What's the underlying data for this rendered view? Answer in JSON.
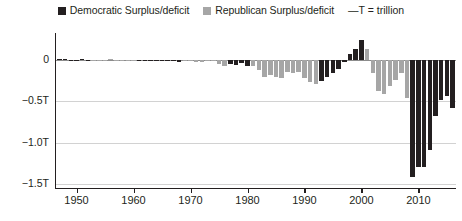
{
  "legend": {
    "democratic": {
      "label": "Democratic Surplus/deficit",
      "color": "#231f20",
      "icon": "square-swatch-icon"
    },
    "republican": {
      "label": "Republican Surplus/deficit",
      "color": "#a6a6a6",
      "icon": "square-swatch-icon"
    },
    "note": "—T = trillion"
  },
  "axes": {
    "y_ticks": [
      "0",
      "−0.5T",
      "−1.0T",
      "−1.5T"
    ],
    "y_tick_values": [
      0,
      -0.5,
      -1.0,
      -1.5
    ],
    "x_ticks": [
      "1950",
      "1960",
      "1970",
      "1980",
      "1990",
      "2000",
      "2010"
    ],
    "x_tick_values": [
      1950,
      1960,
      1970,
      1980,
      1990,
      2000,
      2010
    ]
  },
  "chart_data": {
    "type": "bar",
    "title": "",
    "subtitle": "",
    "xlabel": "",
    "ylabel": "",
    "unit": "trillions of dollars",
    "ylim": [
      -1.55,
      0.3
    ],
    "xlim": [
      1946.4,
      2016.6
    ],
    "grid": true,
    "legend_position": "top-center",
    "series_colors": {
      "Democratic": "#231f20",
      "Republican": "#a6a6a6"
    },
    "categories": [
      1947,
      1948,
      1949,
      1950,
      1951,
      1952,
      1953,
      1954,
      1955,
      1956,
      1957,
      1958,
      1959,
      1960,
      1961,
      1962,
      1963,
      1964,
      1965,
      1966,
      1967,
      1968,
      1969,
      1970,
      1971,
      1972,
      1973,
      1974,
      1975,
      1976,
      1977,
      1978,
      1979,
      1980,
      1981,
      1982,
      1983,
      1984,
      1985,
      1986,
      1987,
      1988,
      1989,
      1990,
      1991,
      1992,
      1993,
      1994,
      1995,
      1996,
      1997,
      1998,
      1999,
      2000,
      2001,
      2002,
      2003,
      2004,
      2005,
      2006,
      2007,
      2008,
      2009,
      2010,
      2011,
      2012,
      2013,
      2014,
      2015,
      2016
    ],
    "party": [
      "Democratic",
      "Democratic",
      "Democratic",
      "Democratic",
      "Democratic",
      "Democratic",
      "Republican",
      "Republican",
      "Republican",
      "Republican",
      "Republican",
      "Republican",
      "Republican",
      "Republican",
      "Democratic",
      "Democratic",
      "Democratic",
      "Democratic",
      "Democratic",
      "Democratic",
      "Democratic",
      "Democratic",
      "Republican",
      "Republican",
      "Republican",
      "Republican",
      "Republican",
      "Republican",
      "Republican",
      "Republican",
      "Democratic",
      "Democratic",
      "Democratic",
      "Democratic",
      "Republican",
      "Republican",
      "Republican",
      "Republican",
      "Republican",
      "Republican",
      "Republican",
      "Republican",
      "Republican",
      "Republican",
      "Republican",
      "Republican",
      "Democratic",
      "Democratic",
      "Democratic",
      "Democratic",
      "Democratic",
      "Democratic",
      "Democratic",
      "Democratic",
      "Republican",
      "Republican",
      "Republican",
      "Republican",
      "Republican",
      "Republican",
      "Republican",
      "Republican",
      "Democratic",
      "Democratic",
      "Democratic",
      "Democratic",
      "Democratic",
      "Democratic",
      "Democratic",
      "Democratic"
    ],
    "values": [
      0.004,
      0.012,
      0.002,
      -0.003,
      0.006,
      -0.002,
      -0.006,
      -0.001,
      -0.003,
      0.004,
      0.003,
      -0.003,
      -0.013,
      0.0,
      -0.003,
      -0.007,
      -0.005,
      -0.006,
      -0.001,
      -0.004,
      -0.009,
      -0.025,
      0.003,
      -0.003,
      -0.023,
      -0.023,
      -0.015,
      -0.006,
      -0.053,
      -0.074,
      -0.054,
      -0.059,
      -0.041,
      -0.074,
      -0.079,
      -0.128,
      -0.208,
      -0.185,
      -0.212,
      -0.221,
      -0.15,
      -0.155,
      -0.153,
      -0.221,
      -0.269,
      -0.29,
      -0.255,
      -0.203,
      -0.164,
      -0.107,
      -0.022,
      0.069,
      0.126,
      0.236,
      0.128,
      -0.158,
      -0.378,
      -0.413,
      -0.318,
      -0.248,
      -0.161,
      -0.459,
      -1.413,
      -1.294,
      -1.3,
      -1.087,
      -0.68,
      -0.485,
      -0.438,
      -0.587
    ],
    "series": [
      {
        "name": "Democratic Surplus/deficit",
        "color": "#231f20"
      },
      {
        "name": "Republican Surplus/deficit",
        "color": "#a6a6a6"
      }
    ]
  }
}
